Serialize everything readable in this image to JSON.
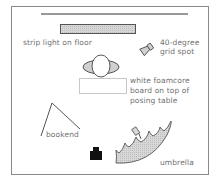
{
  "diagram": {
    "type": "lighting-setup",
    "labels": {
      "strip_light": "strip light on floor",
      "grid_spot_line1": "40-degree",
      "grid_spot_line2": "grid spot",
      "foamcore_line1": "white foamcore",
      "foamcore_line2": "board on top of",
      "foamcore_line3": "posing table",
      "bookend": "bookend",
      "umbrella": "umbrella"
    },
    "elements": [
      {
        "id": "background-line",
        "icon": "line"
      },
      {
        "id": "strip-light",
        "icon": "strip-light-icon"
      },
      {
        "id": "grid-spot",
        "icon": "spotlight-icon"
      },
      {
        "id": "subject",
        "icon": "person-topdown-icon"
      },
      {
        "id": "foamcore-board",
        "icon": "rectangle"
      },
      {
        "id": "bookend",
        "icon": "reflector-v-icon"
      },
      {
        "id": "camera",
        "icon": "camera-icon"
      },
      {
        "id": "umbrella",
        "icon": "umbrella-icon"
      }
    ],
    "colors": {
      "border": "#8a8a8a",
      "line": "#333333",
      "fill_gray": "#cfcfcf",
      "text": "#707070",
      "camera": "#111111"
    }
  }
}
